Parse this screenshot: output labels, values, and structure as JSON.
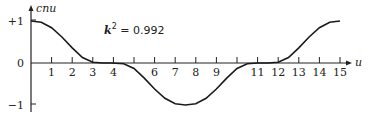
{
  "chart_data": {
    "type": "line",
    "title": "",
    "xlabel": "u",
    "ylabel": "cnu",
    "annotation": {
      "k_label": "k",
      "exponent": "2",
      "text": " = 0.992"
    },
    "xlim": [
      0,
      15.5
    ],
    "ylim": [
      -1.15,
      1.15
    ],
    "xticks": [
      1,
      2,
      3,
      4,
      5,
      6,
      7,
      8,
      9,
      10,
      11,
      12,
      13,
      14,
      15
    ],
    "xtick_labels": [
      "1",
      "2",
      "3",
      "4",
      "",
      "6",
      "7",
      "8",
      "9",
      "",
      "11",
      "12",
      "13",
      "14",
      "15"
    ],
    "yticks": [
      1,
      0,
      -1
    ],
    "ytick_labels": [
      "+1",
      "0",
      "−1"
    ],
    "grid": false,
    "series": [
      {
        "name": "cn u",
        "x": [
          0,
          0.5,
          1,
          1.5,
          2,
          2.5,
          3,
          3.5,
          3.9,
          4.5,
          5,
          5.5,
          6,
          6.5,
          7,
          7.5,
          8,
          8.5,
          9,
          9.5,
          10,
          10.5,
          11,
          11.5,
          12,
          12.5,
          13,
          13.5,
          14,
          14.5,
          15
        ],
        "values": [
          1,
          0.97,
          0.84,
          0.62,
          0.36,
          0.13,
          0.02,
          0.0,
          0.0,
          -0.02,
          -0.13,
          -0.36,
          -0.62,
          -0.84,
          -0.97,
          -1,
          -0.97,
          -0.84,
          -0.62,
          -0.36,
          -0.13,
          -0.02,
          0.0,
          0.0,
          0.02,
          0.13,
          0.36,
          0.62,
          0.84,
          0.97,
          1
        ]
      }
    ]
  }
}
